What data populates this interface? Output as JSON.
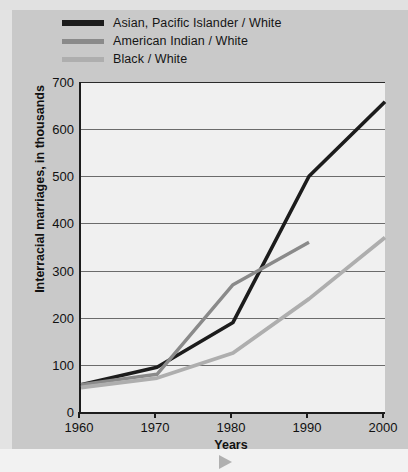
{
  "legend": {
    "items": [
      {
        "label": "Asian, Pacific Islander / White",
        "color": "#1c1c1c",
        "key": "asian"
      },
      {
        "label": "American Indian / White",
        "color": "#8a8a8a",
        "key": "american_indian"
      },
      {
        "label": "Black / White",
        "color": "#aeaeae",
        "key": "black"
      }
    ]
  },
  "ghost": {
    "text": ""
  },
  "chart_data": {
    "type": "line",
    "title": "",
    "xlabel": "Years",
    "ylabel": "Interracial marriages, in thousands",
    "x": [
      1960,
      1970,
      1980,
      1990,
      2000
    ],
    "xtick_labels": [
      "1960",
      "1970",
      "1980",
      "1990",
      "2000"
    ],
    "ytick_labels": [
      "0",
      "100",
      "200",
      "300",
      "400",
      "500",
      "600",
      "700"
    ],
    "yticks": [
      0,
      100,
      200,
      300,
      400,
      500,
      600,
      700
    ],
    "xlim": [
      1960,
      2000
    ],
    "ylim": [
      0,
      700
    ],
    "grid": "horizontal",
    "legend_position": "above-plot",
    "series": [
      {
        "name": "Asian, Pacific Islander / White",
        "color": "#1c1c1c",
        "x": [
          1960,
          1970,
          1980,
          1990,
          2000
        ],
        "values": [
          58,
          95,
          190,
          500,
          658
        ]
      },
      {
        "name": "American Indian / White",
        "color": "#8a8a8a",
        "x": [
          1960,
          1970,
          1980,
          1990
        ],
        "values": [
          58,
          80,
          270,
          360
        ]
      },
      {
        "name": "Black / White",
        "color": "#aeaeae",
        "x": [
          1960,
          1970,
          1980,
          1990,
          2000
        ],
        "values": [
          52,
          72,
          125,
          240,
          370
        ]
      }
    ]
  }
}
